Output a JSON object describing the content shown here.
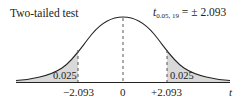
{
  "title": "Two-tailed test",
  "formula": {
    "symbol": "t",
    "subscript": "0.05, 19",
    "rhs": "= ± 2.093"
  },
  "tail_areas": {
    "left": "0.025",
    "right": "0.025"
  },
  "axis": {
    "ticks": [
      {
        "label": "−2.093",
        "value": -2.093
      },
      {
        "label": "0",
        "value": 0
      },
      {
        "label": "+2.093",
        "value": 2.093
      }
    ],
    "variable": "t"
  },
  "colors": {
    "curve": "#222222",
    "shade": "#d9d9d9",
    "dash": "#555555"
  }
}
